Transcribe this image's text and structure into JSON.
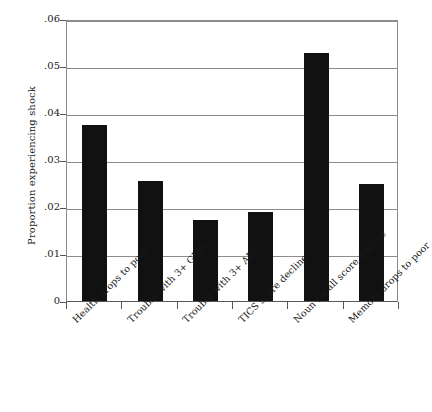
{
  "chart_data": {
    "type": "bar",
    "title": "",
    "xlabel": "",
    "ylabel": "Proportion experiencing shock",
    "categories": [
      "Health drops to poor",
      "Trouble with 3+ GMS",
      "Trouble with 3+ ADL",
      "TICS score decline",
      "Noun recall score decline",
      "Memory drops to poor"
    ],
    "values": [
      0.0375,
      0.0255,
      0.0172,
      0.019,
      0.0528,
      0.025
    ],
    "ylim": [
      0,
      0.06
    ],
    "ytick_values": [
      0,
      0.01,
      0.02,
      0.03,
      0.04,
      0.05,
      0.06
    ],
    "ytick_labels": [
      "0",
      ".01",
      ".02",
      ".03",
      ".04",
      ".05",
      ".06"
    ],
    "grid": true,
    "legend": "none",
    "bar_color": "#111111",
    "grid_color": "#8d8d8d",
    "axis_color": "#555555"
  }
}
